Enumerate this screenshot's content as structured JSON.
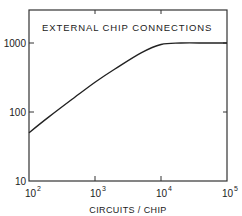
{
  "chart_data": {
    "type": "line",
    "title": "EXTERNAL CHIP CONNECTIONS",
    "xlabel": "CIRCUITS / CHIP",
    "ylabel": "",
    "xscale": "log",
    "yscale": "log",
    "xlim": [
      100,
      100000
    ],
    "ylim": [
      10,
      2000
    ],
    "grid": false,
    "x_ticks": [
      {
        "base": "10",
        "exp": "2"
      },
      {
        "base": "10",
        "exp": "3"
      },
      {
        "base": "10",
        "exp": "4"
      },
      {
        "base": "10",
        "exp": "5"
      }
    ],
    "y_ticks": [
      "10",
      "100",
      "1000"
    ],
    "series": [
      {
        "name": "External chip connections",
        "x": [
          100,
          200,
          500,
          1000,
          2000,
          5000,
          10000,
          20000,
          50000,
          100000
        ],
        "values": [
          50,
          85,
          165,
          270,
          420,
          720,
          950,
          1000,
          1000,
          1000
        ]
      }
    ]
  }
}
